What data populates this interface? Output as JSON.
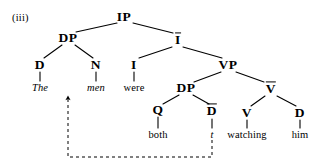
{
  "figure": {
    "example_label": "(iii)",
    "ink_color": "#000000",
    "background_color": "#ffffff"
  },
  "tree": {
    "nodes": [
      {
        "id": "IP",
        "label": "IP",
        "x": 124,
        "y": 17,
        "style": "cat",
        "overbar": false
      },
      {
        "id": "DP1",
        "label": "DP",
        "x": 68,
        "y": 38,
        "style": "cat",
        "overbar": false
      },
      {
        "id": "Ibar",
        "label": "I",
        "x": 178,
        "y": 40,
        "style": "cat-bar",
        "overbar": true
      },
      {
        "id": "D1",
        "label": "D",
        "x": 40,
        "y": 65,
        "style": "cat",
        "overbar": false
      },
      {
        "id": "N1",
        "label": "N",
        "x": 96,
        "y": 65,
        "style": "cat",
        "overbar": false
      },
      {
        "id": "I0",
        "label": "I",
        "x": 134,
        "y": 65,
        "style": "cat",
        "overbar": false
      },
      {
        "id": "VP",
        "label": "VP",
        "x": 228,
        "y": 65,
        "style": "cat",
        "overbar": false
      },
      {
        "id": "DP2",
        "label": "DP",
        "x": 186,
        "y": 88,
        "style": "cat",
        "overbar": false
      },
      {
        "id": "Vbar",
        "label": "V",
        "x": 271,
        "y": 89,
        "style": "cat-bar",
        "overbar": true
      },
      {
        "id": "Q",
        "label": "Q",
        "x": 158,
        "y": 110,
        "style": "cat",
        "overbar": false
      },
      {
        "id": "Dbar",
        "label": "D",
        "x": 212,
        "y": 111,
        "style": "cat-bar",
        "overbar": true
      },
      {
        "id": "V0",
        "label": "V",
        "x": 247,
        "y": 113,
        "style": "cat",
        "overbar": false
      },
      {
        "id": "D2",
        "label": "D",
        "x": 300,
        "y": 113,
        "style": "cat",
        "overbar": false
      }
    ],
    "terminals": [
      {
        "id": "the",
        "label": "The",
        "x": 40,
        "y": 88,
        "italic": true
      },
      {
        "id": "men",
        "label": "men",
        "x": 96,
        "y": 88,
        "italic": true
      },
      {
        "id": "were",
        "label": "were",
        "x": 134,
        "y": 88,
        "italic": false
      },
      {
        "id": "both",
        "label": "both",
        "x": 158,
        "y": 135,
        "italic": false
      },
      {
        "id": "trace",
        "label": "t",
        "x": 212,
        "y": 135,
        "italic": true
      },
      {
        "id": "watching",
        "label": "watching",
        "x": 247,
        "y": 135,
        "italic": false
      },
      {
        "id": "him",
        "label": "him",
        "x": 300,
        "y": 135,
        "italic": false
      }
    ],
    "branches": [
      {
        "from": "IP",
        "to": "DP1",
        "x1": 117,
        "y1": 23,
        "x2": 76,
        "y2": 32
      },
      {
        "from": "IP",
        "to": "Ibar",
        "x1": 133,
        "y1": 23,
        "x2": 173,
        "y2": 33
      },
      {
        "from": "DP1",
        "to": "D1",
        "x1": 62,
        "y1": 45,
        "x2": 44,
        "y2": 58
      },
      {
        "from": "DP1",
        "to": "N1",
        "x1": 75,
        "y1": 45,
        "x2": 93,
        "y2": 58
      },
      {
        "from": "Ibar",
        "to": "I0",
        "x1": 172,
        "y1": 47,
        "x2": 139,
        "y2": 58
      },
      {
        "from": "Ibar",
        "to": "VP",
        "x1": 183,
        "y1": 47,
        "x2": 222,
        "y2": 58
      },
      {
        "from": "VP",
        "to": "DP2",
        "x1": 221,
        "y1": 72,
        "x2": 194,
        "y2": 82
      },
      {
        "from": "VP",
        "to": "Vbar",
        "x1": 236,
        "y1": 72,
        "x2": 264,
        "y2": 82
      },
      {
        "from": "DP2",
        "to": "Q",
        "x1": 179,
        "y1": 95,
        "x2": 163,
        "y2": 104
      },
      {
        "from": "DP2",
        "to": "Dbar",
        "x1": 193,
        "y1": 95,
        "x2": 209,
        "y2": 104
      },
      {
        "from": "Vbar",
        "to": "V0",
        "x1": 265,
        "y1": 96,
        "x2": 251,
        "y2": 106
      },
      {
        "from": "Vbar",
        "to": "D2",
        "x1": 277,
        "y1": 96,
        "x2": 296,
        "y2": 106
      },
      {
        "from": "D1",
        "to": "the",
        "x1": 40,
        "y1": 72,
        "x2": 40,
        "y2": 81
      },
      {
        "from": "N1",
        "to": "men",
        "x1": 96,
        "y1": 72,
        "x2": 96,
        "y2": 81
      },
      {
        "from": "I0",
        "to": "were",
        "x1": 134,
        "y1": 72,
        "x2": 134,
        "y2": 81
      },
      {
        "from": "Q",
        "to": "both",
        "x1": 158,
        "y1": 117,
        "x2": 158,
        "y2": 128
      },
      {
        "from": "Dbar",
        "to": "trace",
        "x1": 212,
        "y1": 119,
        "x2": 212,
        "y2": 128
      },
      {
        "from": "V0",
        "to": "watching",
        "x1": 247,
        "y1": 120,
        "x2": 247,
        "y2": 128
      },
      {
        "from": "D2",
        "to": "him",
        "x1": 300,
        "y1": 120,
        "x2": 300,
        "y2": 128
      }
    ],
    "movement_arrow": {
      "description": "dashed coindexing arrow from trace t to men",
      "path": "M 212 140 L 212 157 L 68 157 L 68 98",
      "dash": "3,3",
      "arrow_tip_x": 68,
      "arrow_tip_y": 95
    }
  }
}
